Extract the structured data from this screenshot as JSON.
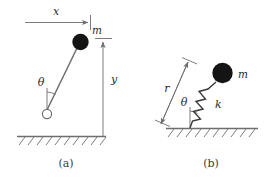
{
  "figure": {
    "background_color": "#ffffff",
    "line_color": "#6e6e6e",
    "mass_color": "#141414",
    "label_color": "#2b2b2b",
    "panels": [
      {
        "id": "a",
        "caption": "(a)",
        "description": "Simple pendulum hanging from a pivot with horizontal displacement x and vertical drop y",
        "labels": {
          "horizontal_dimension": "x",
          "vertical_dimension": "y",
          "mass": "m",
          "angle": "θ"
        }
      },
      {
        "id": "b",
        "caption": "(b)",
        "description": "Mass on a spring anchored to the ground at angle theta with radial length r and stiffness k",
        "labels": {
          "radial_dimension": "r",
          "mass": "m",
          "angle": "θ",
          "spring_constant": "k"
        }
      }
    ]
  }
}
